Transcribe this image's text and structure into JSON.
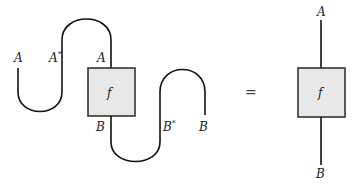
{
  "diagram": {
    "left_side": {
      "labels": {
        "input_A": "A",
        "dual_A": "A",
        "dual_A_star": "*",
        "box_top_A": "A",
        "box_bottom_B": "B",
        "dual_B": "B",
        "dual_B_star": "*",
        "output_B": "B"
      },
      "box_label": "f"
    },
    "equals": "=",
    "right_side": {
      "top_label": "A",
      "box_label": "f",
      "bottom_label": "B"
    },
    "colors": {
      "wire": "#111111",
      "box_fill": "#e8e8e8",
      "box_stroke": "#333333"
    }
  }
}
